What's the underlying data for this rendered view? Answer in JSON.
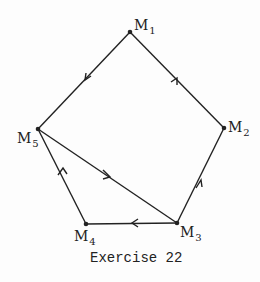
{
  "diagram": {
    "caption": "Exercise 22",
    "nodes": [
      {
        "id": "M1",
        "base": "M",
        "sub": "1",
        "x": 130,
        "y": 32
      },
      {
        "id": "M2",
        "base": "M",
        "sub": "2",
        "x": 224,
        "y": 128
      },
      {
        "id": "M3",
        "base": "M",
        "sub": "3",
        "x": 177,
        "y": 223
      },
      {
        "id": "M4",
        "base": "M",
        "sub": "4",
        "x": 86,
        "y": 224
      },
      {
        "id": "M5",
        "base": "M",
        "sub": "5",
        "x": 38,
        "y": 129
      }
    ],
    "edges": [
      {
        "from": "M1",
        "to": "M5",
        "directed": true
      },
      {
        "from": "M2",
        "to": "M1",
        "directed": true
      },
      {
        "from": "M3",
        "to": "M2",
        "directed": true
      },
      {
        "from": "M3",
        "to": "M4",
        "directed": true
      },
      {
        "from": "M4",
        "to": "M5",
        "directed": true
      },
      {
        "from": "M5",
        "to": "M3",
        "directed": true
      }
    ]
  }
}
